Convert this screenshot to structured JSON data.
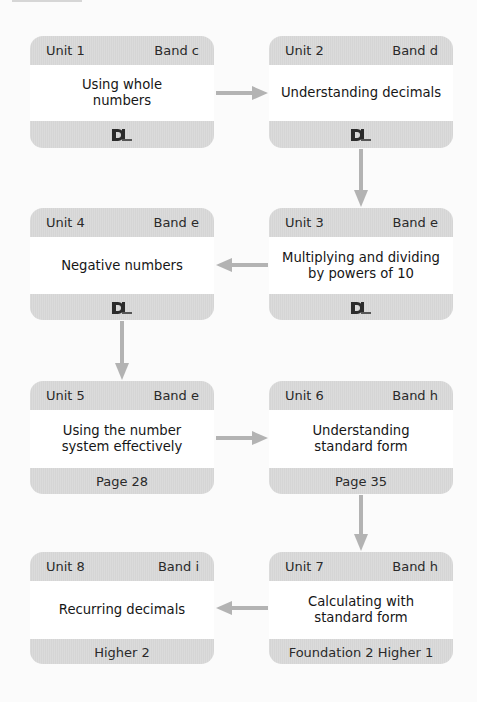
{
  "diagram": {
    "colors": {
      "card_band": "#d9d9d9",
      "card_body": "#ffffff",
      "arrow": "#b3b3b3",
      "text": "#1e1e1e",
      "background": "#fbfbfb"
    },
    "units": [
      {
        "unit": "Unit 1",
        "band": "Band c",
        "title_lines": [
          "Using whole",
          "numbers"
        ],
        "footer": null,
        "footer_icon": "dl-logo-icon"
      },
      {
        "unit": "Unit 2",
        "band": "Band d",
        "title_lines": [
          "Understanding decimals"
        ],
        "footer": null,
        "footer_icon": "dl-logo-icon"
      },
      {
        "unit": "Unit 3",
        "band": "Band e",
        "title_lines": [
          "Multiplying and dividing",
          "by powers of 10"
        ],
        "footer": null,
        "footer_icon": "dl-logo-icon"
      },
      {
        "unit": "Unit 4",
        "band": "Band e",
        "title_lines": [
          "Negative numbers"
        ],
        "footer": null,
        "footer_icon": "dl-logo-icon"
      },
      {
        "unit": "Unit 5",
        "band": "Band e",
        "title_lines": [
          "Using the number",
          "system effectively"
        ],
        "footer": "Page 28"
      },
      {
        "unit": "Unit 6",
        "band": "Band h",
        "title_lines": [
          "Understanding",
          "standard form"
        ],
        "footer": "Page 35"
      },
      {
        "unit": "Unit 7",
        "band": "Band h",
        "title_lines": [
          "Calculating with",
          "standard form"
        ],
        "footer": "Foundation 2 Higher 1"
      },
      {
        "unit": "Unit 8",
        "band": "Band i",
        "title_lines": [
          "Recurring decimals"
        ],
        "footer": "Higher 2"
      }
    ],
    "flow": [
      {
        "from": "Unit 1",
        "to": "Unit 2",
        "direction": "right"
      },
      {
        "from": "Unit 2",
        "to": "Unit 3",
        "direction": "down"
      },
      {
        "from": "Unit 3",
        "to": "Unit 4",
        "direction": "left"
      },
      {
        "from": "Unit 4",
        "to": "Unit 5",
        "direction": "down"
      },
      {
        "from": "Unit 5",
        "to": "Unit 6",
        "direction": "right"
      },
      {
        "from": "Unit 6",
        "to": "Unit 7",
        "direction": "down"
      },
      {
        "from": "Unit 7",
        "to": "Unit 8",
        "direction": "left"
      }
    ]
  }
}
